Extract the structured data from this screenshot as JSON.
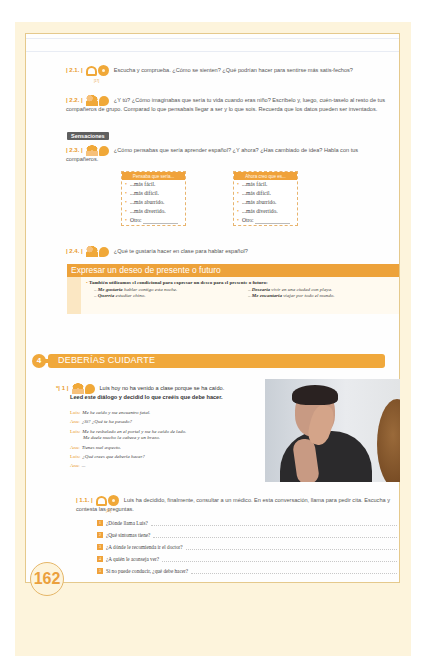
{
  "page": {
    "number": "162",
    "colors": {
      "accent": "#f0a23a",
      "page_bg": "#fdf4dc",
      "frame_border": "#e5c98c",
      "tag_bg": "#5f5f5f"
    }
  },
  "exercises": [
    {
      "num": "| 2.1. |",
      "icons": [
        "listening-icon",
        "audio-cd-icon"
      ],
      "track": "[17]",
      "text": "Escucha y comprueba. ¿Cómo se sienten? ¿Qué podrían hacer para sentirse más satis-fechos?"
    },
    {
      "num": "| 2.2. |",
      "icons": [
        "pair-work-icon",
        "speaking-icon"
      ],
      "text": "¿Y tú? ¿Cómo imaginabas que sería tu vida cuando eras niño? Escríbelo y, luego, cuén-taselo al resto de tus compañeros de grupo. Comparad lo que pensabais llegar a ser y lo que sois. Recuerda que los datos pueden ser inventados."
    }
  ],
  "tag": "Sensaciones",
  "exercise_23": {
    "num": "| 2.3. |",
    "icons": [
      "group-work-icon",
      "speaking-icon"
    ],
    "text": "¿Cómo pensabas que sería aprender español? ¿Y ahora? ¿Has cambiado de idea? Habla con tus compañeros.",
    "tables": [
      {
        "header": "Pensaba que sería...",
        "items": [
          "...más fácil.",
          "...más difícil.",
          "...más aburrido.",
          "...más divertido.",
          "Otro:"
        ]
      },
      {
        "header": "Ahora creo que es...",
        "items": [
          "...más fácil.",
          "...más difícil.",
          "...más aburrido.",
          "...más divertido.",
          "Otro:"
        ]
      }
    ]
  },
  "exercise_24": {
    "num": "| 2.4. |",
    "icons": [
      "pair-work-icon",
      "speaking-icon"
    ],
    "text": "¿Qué te gustaría hacer en clase para hablar español?"
  },
  "grammar_box": {
    "title": "Expresar un deseo de presente o futuro",
    "intro_prefix": "También utilizamos el condicional para ",
    "intro_highlight": "expresar un deseo",
    "intro_suffix": " para el presente o futuro:",
    "examples_left": [
      {
        "verb": "Me gustaría",
        "rest": " hablar contigo esta noche."
      },
      {
        "verb": "Querría",
        "rest": " estudiar chino."
      }
    ],
    "examples_right": [
      {
        "verb": "Desearía",
        "rest": " vivir en una ciudad con playa."
      },
      {
        "verb": "Me encantaría",
        "rest": " viajar por todo el mundo."
      }
    ]
  },
  "section": {
    "number": "4",
    "title": "DEBERÍAS CUIDARTE"
  },
  "exercise_1": {
    "num": "*| 1 |",
    "icons": [
      "group-work-icon",
      "speaking-icon"
    ],
    "text_line1": "Luis hoy no ha venido a clase porque se ha caído.",
    "text_line2": "Leed este diálogo y decidid lo que creéis que debe hacer.",
    "dialog": [
      {
        "speaker": "Luis:",
        "text": "Me he caído y me encuentro fatal."
      },
      {
        "speaker": "Ana:",
        "text": "¿Sí? ¿Qué te ha pasado?"
      },
      {
        "speaker": "Luis:",
        "text": "Me he resbalado en el portal y me he caído de lado."
      },
      {
        "speaker": "",
        "text": "Me duele mucho la cabeza y un brazo."
      },
      {
        "speaker": "Ana:",
        "text": "Tienes mal aspecto."
      },
      {
        "speaker": "Luis:",
        "text": "¿Qué crees que debería hacer?"
      },
      {
        "speaker": "Ana:",
        "text": "..."
      }
    ],
    "photo_alt": "man-holding-head-photo"
  },
  "exercise_11": {
    "num": "| 1.1. |",
    "icons": [
      "listening-icon",
      "audio-cd-icon"
    ],
    "track": "[18]",
    "text": "Luis ha decidido, finalmente, consultar a un médico. En esta conversación, llama para pedir cita. Escucha y contesta las preguntas.",
    "questions": [
      {
        "n": "1",
        "text": "¿Dónde llama Luis?"
      },
      {
        "n": "2",
        "text": "¿Qué síntomas tiene?"
      },
      {
        "n": "3",
        "text": "¿A dónde le recomienda ir el doctor?"
      },
      {
        "n": "4",
        "text": "¿A quién le aconseja ver?"
      },
      {
        "n": "5",
        "text": "Si no puede conducir, ¿qué debe hacer?"
      }
    ]
  }
}
